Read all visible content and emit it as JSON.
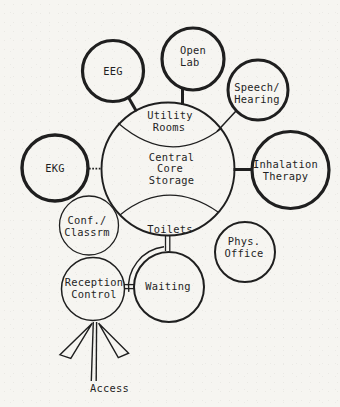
{
  "colors": {
    "ink": "#1f1f1f",
    "paper": "#f6f5f1"
  },
  "diagram": {
    "type": "bubble-adjacency-diagram",
    "nodes": {
      "eeg": {
        "label": "EEG"
      },
      "open_lab": {
        "line1": "Open",
        "line2": "Lab"
      },
      "speech_hearing": {
        "line1": "Speech/",
        "line2": "Hearing"
      },
      "ekg": {
        "label": "EKG"
      },
      "inhalation_therapy": {
        "line1": "Inhalation",
        "line2": "Therapy"
      },
      "utility_rooms": {
        "line1": "Utility",
        "line2": "Rooms"
      },
      "central_core_storage": {
        "line1": "Central",
        "line2": "Core",
        "line3": "Storage"
      },
      "toilets": {
        "label": "Toilets"
      },
      "conf_classrm": {
        "line1": "Conf./",
        "line2": "Classrm"
      },
      "phys_office": {
        "line1": "Phys.",
        "line2": "Office"
      },
      "reception_control": {
        "line1": "Reception",
        "line2": "Control"
      },
      "waiting": {
        "label": "Waiting"
      },
      "access": {
        "label": "Access"
      }
    },
    "central_zones": [
      "Utility Rooms",
      "Central Core Storage",
      "Toilets"
    ],
    "connectors": [
      {
        "from": "eeg",
        "to": "central_core",
        "style": "thick-line"
      },
      {
        "from": "open_lab",
        "to": "central_core",
        "style": "thick-line"
      },
      {
        "from": "speech_hearing",
        "to": "central_core",
        "style": "thin-line"
      },
      {
        "from": "ekg",
        "to": "central_core",
        "style": "dotted-line"
      },
      {
        "from": "inhalation_therapy",
        "to": "central_core",
        "style": "thick-line"
      },
      {
        "from": "toilets",
        "to": "waiting",
        "style": "double-line-corridor"
      },
      {
        "from": "reception_control",
        "to": "waiting",
        "style": "double-line"
      },
      {
        "from": "access",
        "to": "reception_control",
        "style": "triple-arrow"
      }
    ]
  }
}
